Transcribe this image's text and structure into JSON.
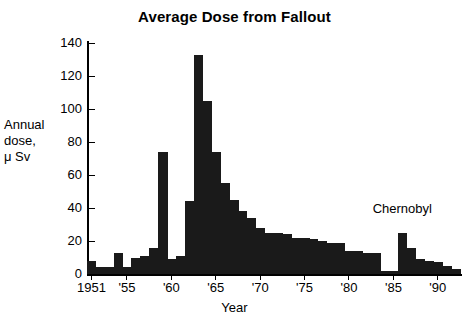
{
  "chart_data": {
    "type": "bar",
    "title": "Average Dose from Fallout",
    "xlabel": "Year",
    "ylabel": "Annual\ndose,\nμ Sv",
    "ylim": [
      0,
      140
    ],
    "xlim": [
      1951,
      1992
    ],
    "grid": false,
    "legend": null,
    "bar_color": "#1a1a1a",
    "y_ticks": [
      0,
      20,
      40,
      60,
      80,
      100,
      120,
      140
    ],
    "y_tick_labels": [
      "0",
      "20",
      "40",
      "60",
      "80",
      "100",
      "120",
      "140"
    ],
    "x_ticks": [
      1951,
      1955,
      1960,
      1965,
      1970,
      1975,
      1980,
      1985,
      1990
    ],
    "x_tick_labels": [
      "1951",
      "'55",
      "'60",
      "'65",
      "'70",
      "'75",
      "'80",
      "'85",
      "'90"
    ],
    "categories": [
      1951,
      1952,
      1953,
      1954,
      1955,
      1956,
      1957,
      1958,
      1959,
      1960,
      1961,
      1962,
      1963,
      1964,
      1965,
      1966,
      1967,
      1968,
      1969,
      1970,
      1971,
      1972,
      1973,
      1974,
      1975,
      1976,
      1977,
      1978,
      1979,
      1980,
      1981,
      1982,
      1983,
      1984,
      1985,
      1986,
      1987,
      1988,
      1989,
      1990,
      1991,
      1992
    ],
    "values": [
      8,
      4,
      4,
      13,
      4,
      10,
      11,
      16,
      74,
      9,
      11,
      44,
      133,
      105,
      74,
      55,
      45,
      38,
      34,
      28,
      25,
      25,
      24,
      22,
      22,
      21,
      20,
      19,
      19,
      14,
      14,
      13,
      13,
      2,
      2,
      25,
      16,
      9,
      8,
      7,
      5,
      3
    ],
    "annotations": [
      {
        "text": "Chernobyl",
        "x": 1986,
        "y": 40
      }
    ]
  }
}
